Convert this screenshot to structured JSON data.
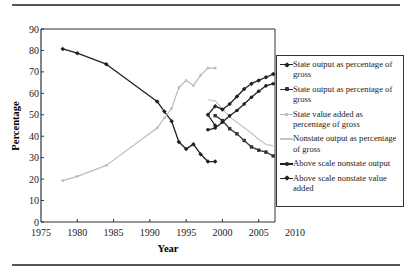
{
  "chart_data": {
    "type": "line",
    "title": "",
    "xlabel": "Year",
    "ylabel": "Percentage",
    "xlim": [
      1975,
      2010
    ],
    "ylim": [
      0,
      90
    ],
    "xticks": [
      1975,
      1980,
      1985,
      1990,
      1995,
      2000,
      2005,
      2010
    ],
    "yticks": [
      0,
      10,
      20,
      30,
      40,
      50,
      60,
      70,
      80,
      90
    ],
    "grid": false,
    "legend_position": "right",
    "series": [
      {
        "name": "State output as percentage of gross",
        "color": "#222222",
        "marker": "diamond",
        "x": [
          1978,
          1980,
          1984,
          1991,
          1992,
          1993,
          1994,
          1995,
          1996,
          1997,
          1998,
          1999
        ],
        "y": [
          80.7,
          78.7,
          73.6,
          56.2,
          51.5,
          47.0,
          37.3,
          34.0,
          36.3,
          31.6,
          28.2,
          28.2
        ]
      },
      {
        "name": "State output as percentage of gross",
        "color": "#333333",
        "marker": "square",
        "x": [
          1999,
          2000,
          2001,
          2002,
          2003,
          2004,
          2005,
          2006,
          2007
        ],
        "y": [
          49.6,
          47.3,
          43.5,
          41.1,
          38.0,
          35.0,
          33.5,
          32.6,
          30.8
        ]
      },
      {
        "name": "State value added as percentage of gross",
        "color": "#bbbbbb",
        "marker": "triangle",
        "x": [
          1978,
          1980,
          1984,
          1991,
          1992,
          1993,
          1994,
          1995,
          1996,
          1997,
          1998,
          1999
        ],
        "y": [
          19.3,
          21.3,
          26.4,
          43.8,
          48.5,
          53.0,
          62.7,
          66.0,
          63.7,
          68.4,
          71.8,
          71.8
        ]
      },
      {
        "name": "Nonstate output as percentage of gross",
        "color": "#c4c4c4",
        "marker": "none",
        "x": [
          1998,
          1999,
          2000,
          2001,
          2002,
          2003,
          2004,
          2005,
          2006,
          2007
        ],
        "y": [
          57.0,
          56.5,
          52.7,
          48.9,
          46.5,
          44.0,
          41.5,
          38.5,
          36.2,
          35.5
        ]
      },
      {
        "name": "Above scale nonstate output",
        "color": "#222222",
        "marker": "circle",
        "x": [
          1998,
          1999,
          2000,
          2001,
          2002,
          2003,
          2004,
          2005,
          2006,
          2007
        ],
        "y": [
          43.0,
          43.8,
          46.5,
          49.5,
          52.0,
          55.0,
          58.2,
          61.0,
          63.5,
          64.5
        ]
      },
      {
        "name": "Above scale nonstate value added",
        "color": "#222222",
        "marker": "diamond",
        "x": [
          1999,
          1998,
          1999,
          2000,
          2001,
          2002,
          2003,
          2004,
          2005,
          2006,
          2007
        ],
        "y": [
          45.0,
          50.0,
          54.0,
          52.5,
          55.0,
          58.5,
          62.0,
          64.5,
          66.0,
          67.5,
          69.0
        ]
      }
    ]
  },
  "legend": {
    "items": [
      {
        "label": "State output as percentage of gross",
        "color": "#222222"
      },
      {
        "label": "State output as percentage of gross",
        "color": "#333333"
      },
      {
        "label": "State value added as percentage of gross",
        "color": "#bbbbbb"
      },
      {
        "label": "Nonstate output as percentage of gross",
        "color": "#c4c4c4"
      },
      {
        "label": "Above scale nonstate output",
        "color": "#222222"
      },
      {
        "label": "Above scale nonstate value added",
        "color": "#222222"
      }
    ]
  }
}
